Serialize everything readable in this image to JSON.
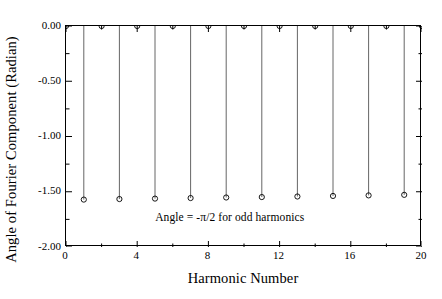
{
  "chart_data": {
    "type": "scatter",
    "title": "",
    "subtitle": "",
    "xlabel": "Harmonic Number",
    "ylabel": "Angle of Fourier Component (Radian)",
    "xlim": [
      0,
      20
    ],
    "ylim": [
      -2.0,
      0.0
    ],
    "grid": false,
    "legend": null,
    "x_major_ticks": [
      0,
      4,
      8,
      12,
      16,
      20
    ],
    "x_major_tick_labels": [
      "0",
      "4",
      "8",
      "12",
      "16",
      "20"
    ],
    "x_minor_ticks": [
      2,
      6,
      10,
      14,
      18
    ],
    "y_major_ticks": [
      0.0,
      -0.5,
      -1.0,
      -1.5,
      -2.0
    ],
    "y_major_tick_labels": [
      "0.00",
      "-0.50",
      "-1.00",
      "-1.50",
      "-2.00"
    ],
    "y_minor_ticks": [
      -0.25,
      -0.75,
      -1.25,
      -1.75
    ],
    "marker": "open-circle",
    "stem_plot": true,
    "x": [
      0,
      1,
      2,
      3,
      4,
      5,
      6,
      7,
      8,
      9,
      10,
      11,
      12,
      13,
      14,
      15,
      16,
      17,
      18,
      19,
      20
    ],
    "values": [
      0.0,
      -1.571,
      0.0,
      -1.566,
      0.0,
      -1.562,
      0.0,
      -1.557,
      0.0,
      -1.552,
      0.0,
      -1.548,
      0.0,
      -1.543,
      0.0,
      -1.538,
      0.0,
      -1.533,
      0.0,
      -1.528,
      0.0
    ],
    "annotations": [
      {
        "text": "Angle = -π/2 for odd harmonics",
        "x": 9.2,
        "y": -1.73
      }
    ]
  },
  "colors": {
    "axis": "#000000",
    "marker": "#000000",
    "stem": "#555555",
    "background": "#ffffff",
    "text": "#000000"
  }
}
